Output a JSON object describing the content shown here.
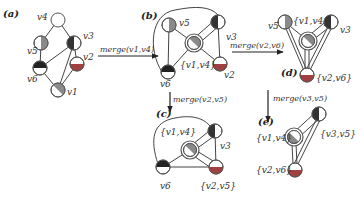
{
  "colors": {
    "edge": "#444444",
    "node_stroke": "#555555",
    "light": "#ffffff",
    "dark": "#222222",
    "gray": "#8a8a8a",
    "red": "#a04040"
  },
  "panels": [
    {
      "id": "a",
      "label": "(a)"
    },
    {
      "id": "b",
      "label": "(b)"
    },
    {
      "id": "c",
      "label": "(c)"
    },
    {
      "id": "d",
      "label": "(d)"
    },
    {
      "id": "e",
      "label": "(e)"
    }
  ],
  "operations": [
    {
      "from": "a",
      "to": "b",
      "label": "merge(v1,v4)"
    },
    {
      "from": "b",
      "to": "c",
      "label": "merge(v2,v5)"
    },
    {
      "from": "b",
      "to": "d",
      "label": "merge(v2,v6)"
    },
    {
      "from": "d",
      "to": "e",
      "label": "merge(v3,v5)"
    }
  ],
  "graph_a": {
    "nodes": [
      {
        "id": "v4",
        "label": "v4",
        "fill": "white"
      },
      {
        "id": "v5",
        "label": "v5",
        "fill": "gray-right"
      },
      {
        "id": "v3",
        "label": "v3",
        "fill": "dark-left"
      },
      {
        "id": "v6",
        "label": "v6",
        "fill": "dark-top"
      },
      {
        "id": "v2",
        "label": "v2",
        "fill": "red-bottom"
      },
      {
        "id": "v1",
        "label": "v1",
        "fill": "gray-diag"
      }
    ],
    "edges": [
      [
        "v4",
        "v5"
      ],
      [
        "v4",
        "v3"
      ],
      [
        "v5",
        "v6"
      ],
      [
        "v6",
        "v3"
      ],
      [
        "v6",
        "v1"
      ],
      [
        "v3",
        "v2"
      ],
      [
        "v3",
        "v1"
      ],
      [
        "v2",
        "v1"
      ]
    ]
  },
  "graph_b": {
    "nodes": [
      {
        "id": "v5",
        "label": "v5"
      },
      {
        "id": "v3",
        "label": "v3"
      },
      {
        "id": "v14",
        "label": "{v1,v4}",
        "merged": true
      },
      {
        "id": "v6",
        "label": "v6"
      },
      {
        "id": "v2",
        "label": "v2"
      }
    ]
  },
  "graph_c": {
    "nodes": [
      {
        "id": "v14",
        "label": "{v1,v4}",
        "merged": true
      },
      {
        "id": "v3",
        "label": "v3"
      },
      {
        "id": "v6",
        "label": "v6"
      },
      {
        "id": "v25",
        "label": "{v2,v5}"
      }
    ]
  },
  "graph_d": {
    "nodes": [
      {
        "id": "v5",
        "label": "v5"
      },
      {
        "id": "v14",
        "label": "{v1,v4}",
        "merged": true
      },
      {
        "id": "v3",
        "label": "v3"
      },
      {
        "id": "v26",
        "label": "{v2,v6}"
      }
    ]
  },
  "graph_e": {
    "nodes": [
      {
        "id": "v14",
        "label": "{v1,v4}",
        "merged": true
      },
      {
        "id": "v35",
        "label": "{v3,v5}"
      },
      {
        "id": "v26",
        "label": "{v2,v6}"
      }
    ]
  }
}
